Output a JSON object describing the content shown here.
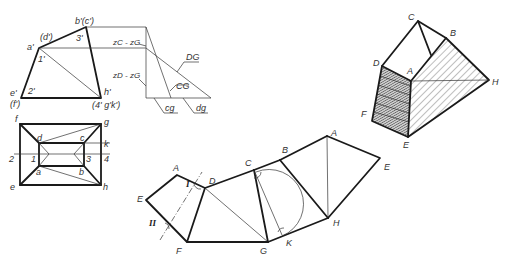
{
  "front_view": {
    "labels": {
      "b_c": "b'(c')",
      "d": "(d')",
      "a": "a'",
      "three": "3'",
      "one": "1'",
      "e": "e'",
      "two": "2'",
      "f": "(f')",
      "h": "h'",
      "bottom_right": "(4' g'k')"
    }
  },
  "true_length_construction": {
    "labels": {
      "zc_zg": "zC - zG",
      "zd_zg": "zD - zG",
      "DG": "DG",
      "CG": "CG",
      "cg": "cg",
      "dg": "dg"
    }
  },
  "top_view": {
    "labels": {
      "f": "f",
      "g": "g",
      "d": "d",
      "c": "c",
      "k": "k",
      "two": "2",
      "one": "1",
      "three": "3",
      "four": "4",
      "a": "a",
      "b": "b",
      "e": "e",
      "h": "h"
    }
  },
  "unfolded_net": {
    "labels": {
      "E_left": "E",
      "A_left": "A",
      "I": "I",
      "II": "II",
      "D": "D",
      "F": "F",
      "C": "C",
      "B": "B",
      "G": "G",
      "K": "K",
      "A_right": "A",
      "H": "H",
      "E_right": "E"
    }
  },
  "isometric_view": {
    "labels": {
      "C": "C",
      "B": "B",
      "D": "D",
      "A": "A",
      "H": "H",
      "F": "F",
      "E": "E"
    },
    "shaded_face": "D-A-E-F",
    "hatched_faces": [
      "A-B-H",
      "A-H-E"
    ]
  },
  "colors": {
    "line": "#1a1a1a",
    "background": "#ffffff",
    "shade": "#555555"
  }
}
